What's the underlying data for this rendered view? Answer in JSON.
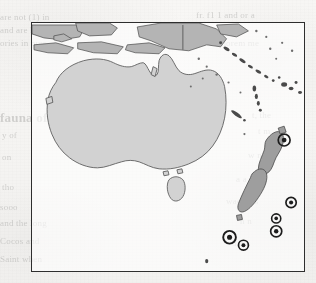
{
  "page": {
    "background_color": "#f5f4f2",
    "width": 316,
    "height": 283,
    "media": "scanned-book-page"
  },
  "map": {
    "title": "Oceania distribution map",
    "region": "Australasia and the South Pacific",
    "frame": {
      "x": 31,
      "y": 22,
      "width": 274,
      "height": 250,
      "border_color": "#2e2e2e",
      "border_width_px": 1.6
    },
    "colors": {
      "land_fill": "#d2d2d2",
      "land_outline": "#5e5e5e",
      "new_zealand_fill": "#9e9e9e",
      "island_fill": "#b4b4b4",
      "marker_color": "#1d1d1d",
      "paper": "#f5f4f2"
    },
    "landmasses": [
      {
        "name": "Australia",
        "fill": "#d2d2d2",
        "shading": "light-gray"
      },
      {
        "name": "Tasmania",
        "fill": "#d2d2d2",
        "shading": "light-gray"
      },
      {
        "name": "New Guinea",
        "fill": "#b4b4b4",
        "shading": "mid-gray"
      },
      {
        "name": "Indonesian archipelago",
        "fill": "#b4b4b4",
        "shading": "mid-gray"
      },
      {
        "name": "New Zealand North Island",
        "fill": "#9e9e9e",
        "shading": "dark-gray"
      },
      {
        "name": "New Zealand South Island",
        "fill": "#9e9e9e",
        "shading": "dark-gray"
      },
      {
        "name": "Solomon Islands",
        "fill": "#4a4a4a",
        "shading": "speckle"
      },
      {
        "name": "Vanuatu",
        "fill": "#4a4a4a",
        "shading": "speckle"
      },
      {
        "name": "New Caledonia",
        "fill": "#4a4a4a",
        "shading": "speckle"
      },
      {
        "name": "Fiji",
        "fill": "#4a4a4a",
        "shading": "speckle"
      }
    ],
    "markers": {
      "symbol": "bullseye",
      "count": 6,
      "description": "Circular ring with solid centre dot marking record localities east and south-east of New Zealand",
      "points": [
        {
          "id": 1,
          "x": 285,
          "y": 140,
          "radius": 6.0,
          "size": "large"
        },
        {
          "id": 2,
          "x": 292,
          "y": 203,
          "radius": 5.2,
          "size": "medium"
        },
        {
          "id": 3,
          "x": 277,
          "y": 219,
          "radius": 4.6,
          "size": "small"
        },
        {
          "id": 4,
          "x": 277,
          "y": 232,
          "radius": 5.6,
          "size": "medium"
        },
        {
          "id": 5,
          "x": 230,
          "y": 238,
          "radius": 6.4,
          "size": "large"
        },
        {
          "id": 6,
          "x": 244,
          "y": 246,
          "radius": 5.0,
          "size": "small"
        }
      ]
    }
  },
  "bleed_through": {
    "note": "Faint mirrored text showing through from the reverse side of the page",
    "lines": [
      {
        "text": "are not (1) in",
        "x": 0,
        "y": 12,
        "size": 9
      },
      {
        "text": "and are kno",
        "x": 0,
        "y": 25,
        "size": 9
      },
      {
        "text": "ories in pres",
        "x": 0,
        "y": 38,
        "size": 9
      },
      {
        "text": "fauna of those domains",
        "x": 0,
        "y": 110,
        "size": 13,
        "head": true
      },
      {
        "text": "y of",
        "x": 2,
        "y": 130,
        "size": 9
      },
      {
        "text": "on",
        "x": 2,
        "y": 152,
        "size": 9
      },
      {
        "text": "tho",
        "x": 2,
        "y": 182,
        "size": 9
      },
      {
        "text": "sooo",
        "x": 0,
        "y": 202,
        "size": 9
      },
      {
        "text": "and the long",
        "x": 0,
        "y": 218,
        "size": 9
      },
      {
        "text": "Cocos and",
        "x": 0,
        "y": 236,
        "size": 9
      },
      {
        "text": "Saint when",
        "x": 0,
        "y": 254,
        "size": 9
      },
      {
        "text": "fr. f1 1 and or a",
        "x": 196,
        "y": 10,
        "size": 9
      },
      {
        "text": "a a - r - a e",
        "x": 205,
        "y": 24,
        "size": 9
      },
      {
        "text": "pass e norem me",
        "x": 196,
        "y": 38,
        "size": 9
      },
      {
        "text": "t, the",
        "x": 252,
        "y": 110,
        "size": 9
      },
      {
        "text": "t m",
        "x": 258,
        "y": 126,
        "size": 9
      },
      {
        "text": "w n",
        "x": 248,
        "y": 150,
        "size": 9
      },
      {
        "text": "a a",
        "x": 236,
        "y": 174,
        "size": 9
      },
      {
        "text": "wae ress",
        "x": 226,
        "y": 196,
        "size": 9
      },
      {
        "text": "n n",
        "x": 240,
        "y": 216,
        "size": 9
      },
      {
        "text": "d a a",
        "x": 232,
        "y": 238,
        "size": 9
      }
    ]
  }
}
